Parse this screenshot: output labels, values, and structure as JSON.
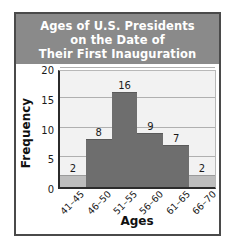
{
  "figure": {
    "title_lines": [
      "Ages of U.S. Presidents",
      "on the Date of",
      "Their First Inauguration"
    ],
    "title_banner_color": "#8a8a8a",
    "title_text_color": "#ffffff"
  },
  "chart_data": {
    "type": "bar",
    "title": "Ages of U.S. Presidents on the Date of Their First Inauguration",
    "xlabel": "Ages",
    "ylabel": "Frequency",
    "categories": [
      "41–45",
      "46–50",
      "51–55",
      "56–60",
      "61–65",
      "66–70"
    ],
    "values": [
      2,
      8,
      16,
      9,
      7,
      2
    ],
    "value_labels": [
      "2",
      "8",
      "16",
      "9",
      "7",
      "2"
    ],
    "bar_colors": [
      "#bdbdbd",
      "#6e6e6e",
      "#6e6e6e",
      "#6e6e6e",
      "#6e6e6e",
      "#bdbdbd"
    ],
    "ylim": [
      0,
      20
    ],
    "yticks": [
      0,
      5,
      10,
      15,
      20
    ],
    "ytick_labels": [
      "0",
      "5",
      "10",
      "15",
      "20"
    ],
    "grid": true,
    "legend": false,
    "plot_background": "#f2f2f2"
  }
}
